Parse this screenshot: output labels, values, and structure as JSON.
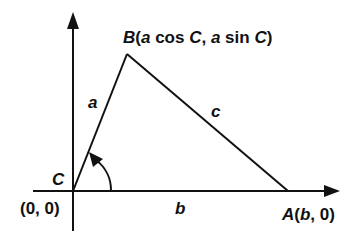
{
  "diagram": {
    "type": "triangle-on-coordinate-axes",
    "colors": {
      "stroke": "#111111",
      "background": "#ffffff"
    },
    "vertices": {
      "B": {
        "name": "B",
        "coords_label": "(a cos C, a sin C)",
        "parts": [
          "B",
          "(",
          "a",
          " cos ",
          "C",
          ", ",
          "a",
          " sin ",
          "C",
          ")"
        ]
      },
      "C": {
        "name": "C",
        "coords_label": "(0, 0)"
      },
      "A": {
        "name": "A",
        "coords_label": "(b, 0)",
        "parts": [
          "A",
          "(",
          "b",
          ", 0)"
        ]
      }
    },
    "sides": {
      "a": "a",
      "b": "b",
      "c": "c"
    },
    "angle_marker": "C"
  }
}
